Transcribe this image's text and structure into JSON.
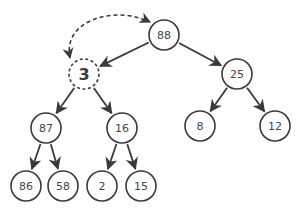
{
  "diagram": {
    "type": "binary-tree",
    "stroke_color": "#3a3a3a",
    "background": "#ffffff",
    "nodes": [
      {
        "id": "n88",
        "label": "88",
        "x": 164,
        "y": 35,
        "style": "solid"
      },
      {
        "id": "n3",
        "label": "3",
        "x": 84,
        "y": 74,
        "style": "dashed"
      },
      {
        "id": "n25",
        "label": "25",
        "x": 237,
        "y": 74,
        "style": "solid"
      },
      {
        "id": "n87",
        "label": "87",
        "x": 46,
        "y": 128,
        "style": "solid"
      },
      {
        "id": "n16",
        "label": "16",
        "x": 122,
        "y": 128,
        "style": "solid"
      },
      {
        "id": "n8",
        "label": "8",
        "x": 200,
        "y": 126,
        "style": "solid"
      },
      {
        "id": "n12",
        "label": "12",
        "x": 275,
        "y": 126,
        "style": "solid"
      },
      {
        "id": "n86",
        "label": "86",
        "x": 26,
        "y": 186,
        "style": "solid"
      },
      {
        "id": "n58",
        "label": "58",
        "x": 63,
        "y": 186,
        "style": "solid"
      },
      {
        "id": "n2",
        "label": "2",
        "x": 102,
        "y": 186,
        "style": "solid"
      },
      {
        "id": "n15",
        "label": "15",
        "x": 141,
        "y": 186,
        "style": "solid"
      }
    ],
    "edges": [
      {
        "from": "n88",
        "to": "n3"
      },
      {
        "from": "n88",
        "to": "n25"
      },
      {
        "from": "n3",
        "to": "n87"
      },
      {
        "from": "n3",
        "to": "n16"
      },
      {
        "from": "n25",
        "to": "n8"
      },
      {
        "from": "n25",
        "to": "n12"
      },
      {
        "from": "n87",
        "to": "n86"
      },
      {
        "from": "n87",
        "to": "n58"
      },
      {
        "from": "n16",
        "to": "n2"
      },
      {
        "from": "n16",
        "to": "n15"
      }
    ],
    "swap_arrow": {
      "between": [
        "n3",
        "n88"
      ],
      "style": "dashed",
      "bidirectional": true
    }
  }
}
